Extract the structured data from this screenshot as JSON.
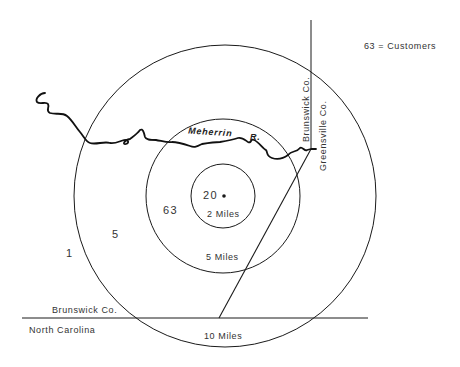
{
  "legend": {
    "text": "63 = Customers"
  },
  "rings": [
    {
      "label": "2 Miles",
      "count": "20"
    },
    {
      "label": "5 Miles",
      "count": "63"
    },
    {
      "label": "10 Miles",
      "count": "5"
    }
  ],
  "outside_count": "1",
  "river": {
    "name": "Meherrin",
    "suffix": "R."
  },
  "counties": {
    "west_of_line": "Brunswick Co.",
    "east_of_line": "Greensville Co.",
    "north_of_state_line": "Brunswick Co.",
    "south_of_state_line": "North Carolina"
  },
  "colors": {
    "line": "#1a1a1a",
    "background": "#ffffff"
  }
}
